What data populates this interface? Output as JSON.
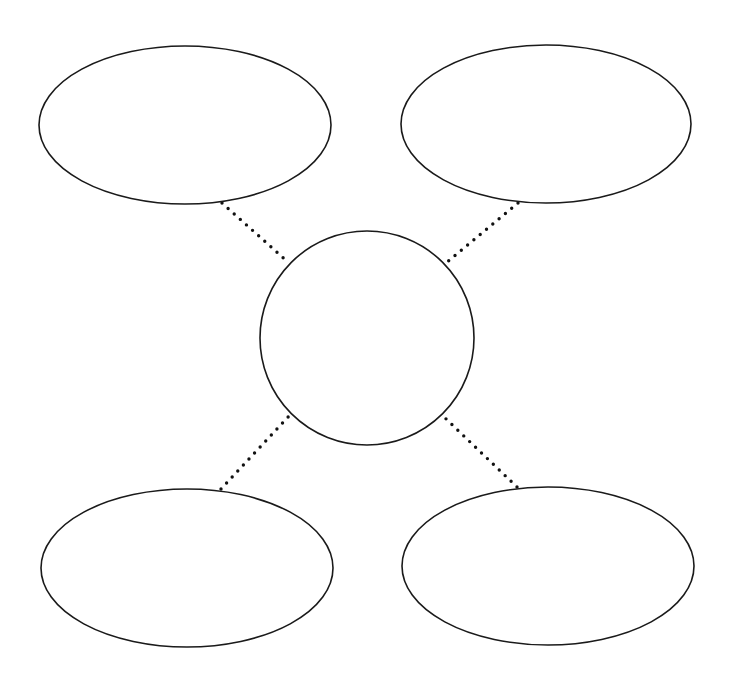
{
  "diagram": {
    "type": "concept-map-template",
    "background_color": "#ffffff",
    "stroke_color": "#1a1a1a",
    "center": {
      "shape": "circle",
      "label": "",
      "cx": 367,
      "cy": 338,
      "r": 107
    },
    "satellites": [
      {
        "id": "top-left",
        "shape": "ellipse",
        "label": "",
        "cx": 185,
        "cy": 125,
        "rx": 146,
        "ry": 79
      },
      {
        "id": "top-right",
        "shape": "ellipse",
        "label": "",
        "cx": 546,
        "cy": 124,
        "rx": 145,
        "ry": 79
      },
      {
        "id": "bottom-left",
        "shape": "ellipse",
        "label": "",
        "cx": 187,
        "cy": 568,
        "rx": 146,
        "ry": 79
      },
      {
        "id": "bottom-right",
        "shape": "ellipse",
        "label": "",
        "cx": 548,
        "cy": 566,
        "rx": 146,
        "ry": 79
      }
    ],
    "connectors": [
      {
        "from": "top-left",
        "to": "center",
        "style": "dotted",
        "x1": 222,
        "y1": 203,
        "x2": 289,
        "y2": 263
      },
      {
        "from": "top-right",
        "to": "center",
        "style": "dotted",
        "x1": 518,
        "y1": 203,
        "x2": 446,
        "y2": 263
      },
      {
        "from": "bottom-left",
        "to": "center",
        "style": "dotted",
        "x1": 221,
        "y1": 489,
        "x2": 290,
        "y2": 415
      },
      {
        "from": "bottom-right",
        "to": "center",
        "style": "dotted",
        "x1": 517,
        "y1": 487,
        "x2": 443,
        "y2": 416
      }
    ]
  }
}
